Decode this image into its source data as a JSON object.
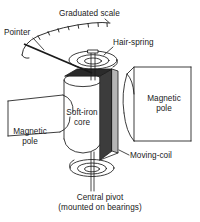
{
  "figure": {
    "title_visible": false,
    "type": "moving-coil-meter-cutaway-diagram",
    "background_color": "#ffffff",
    "line_color": "#1a1a1a"
  },
  "labels": {
    "graduated_scale": "Graduated scale",
    "pointer": "Pointer",
    "hair_spring": "Hair-spring",
    "magnetic_pole_right_line1": "Magnetic",
    "magnetic_pole_right_line2": "pole",
    "magnetic_pole_left_line1": "Magnetic",
    "magnetic_pole_left_line2": "pole",
    "soft_iron_core_line1": "Soft-iron",
    "soft_iron_core_line2": "core",
    "moving_coil": "Moving-coil",
    "central_pivot": "Central pivot",
    "central_pivot_sub": "(mounted on bearings)"
  },
  "colors": {
    "stroke": "#1a1a1a",
    "coil_front_face": "#3c3c3c",
    "coil_side_face": "#9a9a9a",
    "coil_top_face": "#2b2b2b",
    "paper": "#ffffff"
  },
  "parts": [
    {
      "name": "graduated-scale",
      "shape": "arc-with-tick-marks"
    },
    {
      "name": "pointer",
      "shape": "straight-needle"
    },
    {
      "name": "hair-spring",
      "shape": "flat-spiral"
    },
    {
      "name": "soft-iron-core",
      "shape": "cylinder"
    },
    {
      "name": "moving-coil",
      "shape": "thin-rectangular-former"
    },
    {
      "name": "magnetic-pole-left",
      "shape": "curved-pole-piece"
    },
    {
      "name": "magnetic-pole-right",
      "shape": "curved-pole-piece"
    },
    {
      "name": "central-pivot",
      "shape": "flat-spiral-on-spindle"
    },
    {
      "name": "spindle",
      "shape": "vertical-shaft"
    }
  ]
}
